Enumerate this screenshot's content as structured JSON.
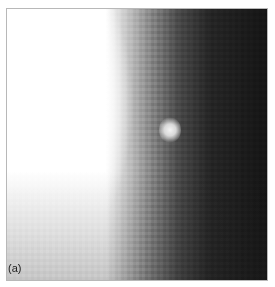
{
  "figure": {
    "panel_label": "(a)"
  }
}
